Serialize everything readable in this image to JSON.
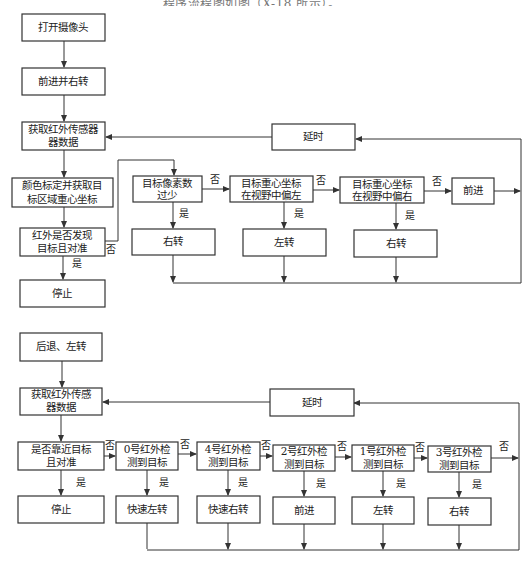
{
  "caption_fragment": "…程序流程图如图（X-18 所示）。",
  "flowchart1": {
    "nodes": {
      "open_camera": "打开摄像头",
      "forward_right": "前进并右转",
      "get_ir_1": "获取红外传感器",
      "get_ir_2": "器数据",
      "color_calib_1": "颜色标定并获取目",
      "color_calib_2": "标区域重心坐标",
      "ir_found_1": "红外是否发现",
      "ir_found_2": "目标且对准",
      "stop": "停止",
      "pixels_few_1": "目标像素数",
      "pixels_few_2": "过少",
      "turn_right_a": "右转",
      "left_bias_1": "目标重心坐标",
      "left_bias_2": "在视野中偏左",
      "turn_left": "左转",
      "right_bias_1": "目标重心坐标",
      "right_bias_2": "在视野中偏右",
      "turn_right_b": "右转",
      "forward": "前进",
      "delay": "延时"
    },
    "labels": {
      "yes": "是",
      "no": "否"
    }
  },
  "flowchart2": {
    "nodes": {
      "back_left": "后退、左转",
      "get_ir_1": "获取红外传感",
      "get_ir_2": "器数据",
      "near_target_1": "是否靠近目标",
      "near_target_2": "且对准",
      "stop": "停止",
      "ir0_1": "0号红外检",
      "ir0_2": "测到目标",
      "fast_left": "快速左转",
      "ir4_1": "4号红外检",
      "ir4_2": "测到目标",
      "fast_right": "快速右转",
      "ir2_1": "2号红外检",
      "ir2_2": "测到目标",
      "forward": "前进",
      "ir1_1": "1号红外检",
      "ir1_2": "测到目标",
      "turn_left": "左转",
      "ir3_1": "3号红外检",
      "ir3_2": "测到目标",
      "turn_right": "右转",
      "delay": "延时"
    },
    "labels": {
      "yes": "是",
      "no": "否"
    }
  }
}
